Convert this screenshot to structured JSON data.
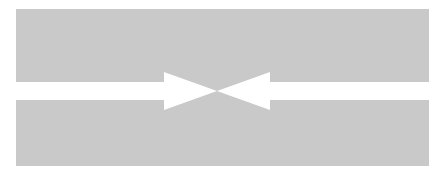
{
  "diagram": {
    "colors": {
      "band": "#c9c9c9",
      "arrow": "#ffffff",
      "background": "#ffffff"
    },
    "arrows": [
      {
        "name": "left-arrow",
        "direction": "right"
      },
      {
        "name": "right-arrow",
        "direction": "left"
      }
    ]
  }
}
